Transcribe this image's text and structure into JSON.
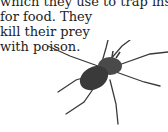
{
  "passage": {
    "lines": [
      "which they use to trap insects",
      "for food. They",
      "kill their prey",
      "with poison."
    ]
  },
  "illustration": {
    "subject": "spider",
    "color": "#3a3a3a"
  }
}
